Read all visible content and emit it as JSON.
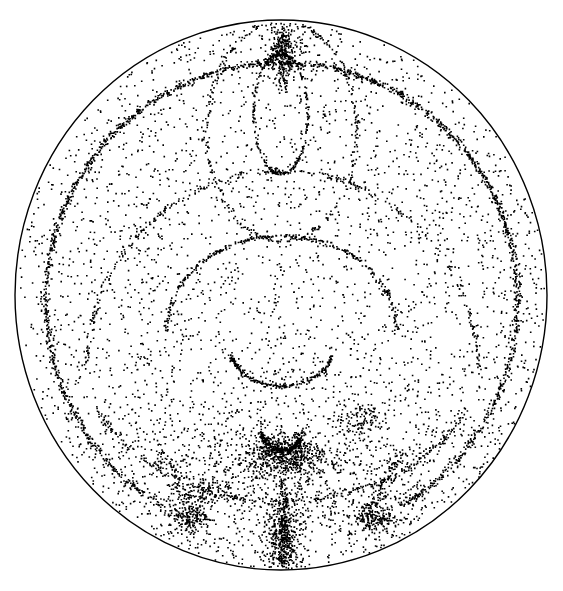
{
  "figure": {
    "width": 563,
    "height": 591,
    "background": "#ffffff",
    "dot_color": "#000000",
    "boundary": {
      "cx": 281,
      "cy": 295,
      "rx": 266,
      "ry": 275,
      "stroke": "#000000",
      "stroke_width": 1.4
    },
    "seed": 1337,
    "background_dots": 3200,
    "curves": [
      {
        "name": "outer-ring",
        "type": "ellipse-arc",
        "cx": 281,
        "cy": 300,
        "rx": 236,
        "ry": 238,
        "a0": 195,
        "a1": 345,
        "n": 900,
        "spread": 1.6
      },
      {
        "name": "outer-ring-lower-left",
        "type": "ellipse-arc",
        "cx": 281,
        "cy": 300,
        "rx": 236,
        "ry": 238,
        "a0": 120,
        "a1": 195,
        "n": 380,
        "spread": 1.8
      },
      {
        "name": "outer-ring-lower-right",
        "type": "ellipse-arc",
        "cx": 281,
        "cy": 300,
        "rx": 236,
        "ry": 238,
        "a0": 345,
        "a1": 420,
        "n": 380,
        "spread": 1.8
      },
      {
        "name": "top-loop",
        "type": "ellipse-arc",
        "cx": 280,
        "cy": 113,
        "rx": 27,
        "ry": 60,
        "a0": 0,
        "a1": 360,
        "n": 260,
        "spread": 0.8
      },
      {
        "name": "upper-arch",
        "type": "ellipse-arc",
        "cx": 281,
        "cy": 130,
        "rx": 75,
        "ry": 110,
        "a0": 0,
        "a1": 360,
        "n": 320,
        "spread": 1.4
      },
      {
        "name": "middle-arch",
        "type": "ellipse-arc",
        "cx": 281,
        "cy": 330,
        "rx": 115,
        "ry": 95,
        "a0": 180,
        "a1": 360,
        "n": 300,
        "spread": 1.2
      },
      {
        "name": "middle-smile",
        "type": "ellipse-arc",
        "cx": 281,
        "cy": 345,
        "rx": 52,
        "ry": 40,
        "a0": 15,
        "a1": 165,
        "n": 230,
        "spread": 1.4
      },
      {
        "name": "large-arch",
        "type": "ellipse-arc",
        "cx": 281,
        "cy": 370,
        "rx": 196,
        "ry": 200,
        "a0": 180,
        "a1": 360,
        "n": 330,
        "spread": 1.6
      },
      {
        "name": "lower-band",
        "type": "ellipse-arc",
        "cx": 281,
        "cy": 340,
        "rx": 205,
        "ry": 160,
        "a0": 25,
        "a1": 155,
        "n": 280,
        "spread": 1.8
      },
      {
        "name": "lower-smile",
        "type": "ellipse-arc",
        "cx": 281,
        "cy": 420,
        "rx": 22,
        "ry": 30,
        "a0": 20,
        "a1": 160,
        "n": 260,
        "spread": 2.0
      }
    ],
    "clusters": [
      {
        "name": "top-pole",
        "cx": 282,
        "cy": 52,
        "sx": 8,
        "sy": 14,
        "n": 260
      },
      {
        "name": "center-blob",
        "cx": 281,
        "cy": 455,
        "sx": 22,
        "sy": 10,
        "n": 520
      },
      {
        "name": "lower-diffuse",
        "cx": 281,
        "cy": 470,
        "sx": 110,
        "sy": 45,
        "n": 1100
      },
      {
        "name": "bottom-pole",
        "cx": 283,
        "cy": 540,
        "sx": 9,
        "sy": 22,
        "n": 420
      },
      {
        "name": "left-knot",
        "cx": 188,
        "cy": 518,
        "sx": 10,
        "sy": 8,
        "n": 170
      },
      {
        "name": "right-knot",
        "cx": 375,
        "cy": 518,
        "sx": 12,
        "sy": 8,
        "n": 190
      },
      {
        "name": "left-mid-knot",
        "cx": 210,
        "cy": 490,
        "sx": 8,
        "sy": 7,
        "n": 80
      },
      {
        "name": "right-mid-knot",
        "cx": 360,
        "cy": 420,
        "sx": 10,
        "sy": 10,
        "n": 90
      }
    ],
    "spokes": [
      {
        "name": "bottom-vertical",
        "x0": 283,
        "y0": 480,
        "x1": 283,
        "y1": 570,
        "n": 160,
        "spread": 2.5
      },
      {
        "name": "top-vertical",
        "x0": 282,
        "y0": 22,
        "x1": 282,
        "y1": 90,
        "n": 90,
        "spread": 2.5
      },
      {
        "name": "lower-left-diag",
        "x0": 160,
        "y0": 450,
        "x1": 200,
        "y1": 520,
        "n": 90,
        "spread": 3
      },
      {
        "name": "lower-right-diag",
        "x0": 400,
        "y0": 450,
        "x1": 365,
        "y1": 520,
        "n": 90,
        "spread": 3
      }
    ]
  }
}
